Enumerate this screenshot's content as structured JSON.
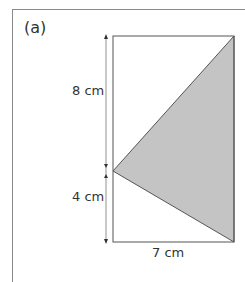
{
  "part_label": "(a)",
  "dimensions": {
    "upper_height": "8 cm",
    "lower_height": "4 cm",
    "width": "7 cm"
  },
  "colors": {
    "shade": "#c4c4c4",
    "line": "#555555",
    "frame": "#8a8a8a"
  },
  "shape": {
    "rectangle": {
      "x": 113,
      "y": 36,
      "w": 121,
      "h": 206
    },
    "triangle": [
      [
        234,
        36
      ],
      [
        113,
        171
      ],
      [
        234,
        242
      ]
    ]
  }
}
